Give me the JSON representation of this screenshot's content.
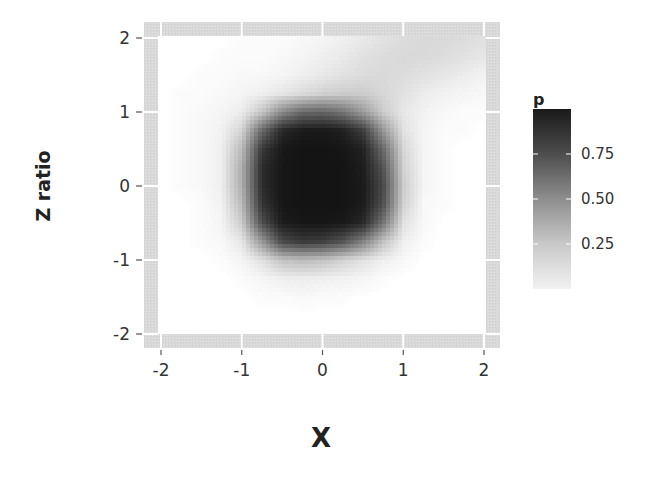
{
  "chart_data": {
    "type": "heatmap",
    "title": "",
    "xlabel": "X",
    "ylabel": "Z ratio",
    "xlim": [
      -2,
      2
    ],
    "ylim": [
      -2,
      2
    ],
    "x_ticks": [
      -2,
      -1,
      0,
      1,
      2
    ],
    "x_tick_labels": [
      "-2",
      "-1",
      "0",
      "1",
      "2"
    ],
    "y_ticks": [
      -2,
      -1,
      0,
      1,
      2
    ],
    "y_tick_labels": [
      "-2",
      "-1",
      "0",
      "1",
      "2"
    ],
    "grid": true,
    "legend": {
      "title": "p",
      "placement": "right",
      "range": [
        0,
        1
      ],
      "ticks": [
        0.25,
        0.5,
        0.75
      ],
      "tick_labels": [
        "0.25",
        "0.50",
        "0.75"
      ],
      "low_color": "#f5f5f5",
      "high_color": "#111111"
    },
    "grid_x": [
      -2,
      -1.75,
      -1.5,
      -1.25,
      -1,
      -0.75,
      -0.5,
      -0.25,
      0,
      0.25,
      0.5,
      0.75,
      1,
      1.25,
      1.5,
      1.75,
      2
    ],
    "grid_y": [
      2,
      1.75,
      1.5,
      1.25,
      1,
      0.75,
      0.5,
      0.25,
      0,
      -0.25,
      -0.5,
      -0.75,
      -1,
      -1.25,
      -1.5,
      -1.75,
      -2
    ],
    "p_values": [
      [
        0.0,
        0.0,
        0.0,
        0.0,
        0.01,
        0.01,
        0.01,
        0.02,
        0.03,
        0.05,
        0.07,
        0.1,
        0.12,
        0.13,
        0.13,
        0.12,
        0.1
      ],
      [
        0.0,
        0.0,
        0.0,
        0.01,
        0.01,
        0.01,
        0.02,
        0.03,
        0.05,
        0.07,
        0.1,
        0.12,
        0.13,
        0.13,
        0.12,
        0.1,
        0.08
      ],
      [
        0.0,
        0.0,
        0.01,
        0.01,
        0.02,
        0.02,
        0.03,
        0.05,
        0.07,
        0.1,
        0.12,
        0.13,
        0.12,
        0.1,
        0.08,
        0.06,
        0.04
      ],
      [
        0.0,
        0.01,
        0.01,
        0.02,
        0.03,
        0.05,
        0.08,
        0.12,
        0.16,
        0.18,
        0.18,
        0.14,
        0.1,
        0.06,
        0.04,
        0.03,
        0.02
      ],
      [
        0.0,
        0.01,
        0.02,
        0.03,
        0.06,
        0.2,
        0.45,
        0.6,
        0.62,
        0.55,
        0.38,
        0.18,
        0.08,
        0.04,
        0.02,
        0.01,
        0.01
      ],
      [
        0.0,
        0.01,
        0.02,
        0.04,
        0.15,
        0.6,
        0.9,
        0.96,
        0.97,
        0.94,
        0.8,
        0.4,
        0.1,
        0.03,
        0.01,
        0.01,
        0.0
      ],
      [
        0.0,
        0.01,
        0.02,
        0.05,
        0.25,
        0.82,
        0.97,
        0.99,
        0.99,
        0.98,
        0.93,
        0.6,
        0.14,
        0.03,
        0.01,
        0.0,
        0.0
      ],
      [
        0.0,
        0.01,
        0.02,
        0.05,
        0.3,
        0.88,
        0.98,
        0.99,
        0.99,
        0.99,
        0.95,
        0.7,
        0.16,
        0.03,
        0.01,
        0.0,
        0.0
      ],
      [
        0.0,
        0.01,
        0.02,
        0.05,
        0.3,
        0.88,
        0.98,
        0.99,
        0.99,
        0.99,
        0.96,
        0.75,
        0.18,
        0.03,
        0.01,
        0.0,
        0.0
      ],
      [
        0.0,
        0.0,
        0.01,
        0.04,
        0.25,
        0.84,
        0.98,
        0.99,
        0.99,
        0.99,
        0.96,
        0.72,
        0.16,
        0.02,
        0.01,
        0.0,
        0.0
      ],
      [
        0.0,
        0.0,
        0.01,
        0.03,
        0.18,
        0.72,
        0.95,
        0.98,
        0.98,
        0.97,
        0.9,
        0.55,
        0.1,
        0.02,
        0.0,
        0.0,
        0.0
      ],
      [
        0.0,
        0.0,
        0.01,
        0.02,
        0.08,
        0.4,
        0.75,
        0.82,
        0.8,
        0.7,
        0.5,
        0.22,
        0.05,
        0.01,
        0.0,
        0.0,
        0.0
      ],
      [
        0.0,
        0.0,
        0.0,
        0.01,
        0.03,
        0.1,
        0.22,
        0.25,
        0.22,
        0.16,
        0.1,
        0.05,
        0.02,
        0.0,
        0.0,
        0.0,
        0.0
      ],
      [
        0.0,
        0.0,
        0.0,
        0.0,
        0.01,
        0.03,
        0.05,
        0.06,
        0.05,
        0.04,
        0.03,
        0.01,
        0.0,
        0.0,
        0.0,
        0.0,
        0.0
      ],
      [
        0.0,
        0.0,
        0.0,
        0.0,
        0.0,
        0.01,
        0.01,
        0.02,
        0.01,
        0.01,
        0.0,
        0.0,
        0.0,
        0.0,
        0.0,
        0.0,
        0.0
      ],
      [
        0.0,
        0.0,
        0.0,
        0.0,
        0.0,
        0.0,
        0.0,
        0.0,
        0.0,
        0.0,
        0.0,
        0.0,
        0.0,
        0.0,
        0.0,
        0.0,
        0.0
      ],
      [
        0.0,
        0.0,
        0.0,
        0.0,
        0.0,
        0.0,
        0.0,
        0.0,
        0.0,
        0.0,
        0.0,
        0.0,
        0.0,
        0.0,
        0.0,
        0.0,
        0.0
      ]
    ]
  }
}
